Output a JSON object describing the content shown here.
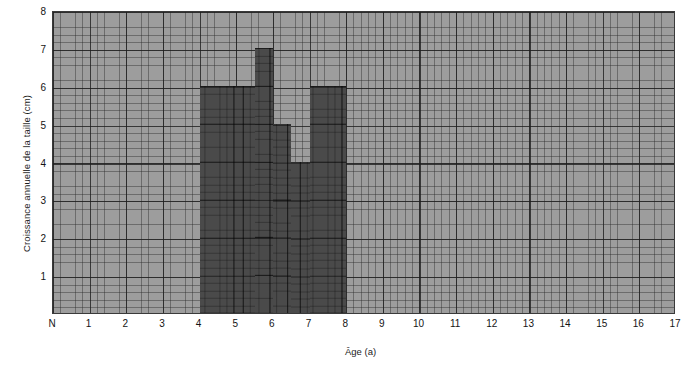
{
  "figure": {
    "background_color": "#ffffff",
    "plot_fill_color": "#9d9d9d",
    "bar_color": "#4a4a4a",
    "axis_color": "#3a3a3a"
  },
  "axes": {
    "x_title": "Âge (a)",
    "y_title": "Croissance annuelle de la taille (cm)",
    "x_ticks": [
      "N",
      "1",
      "2",
      "3",
      "4",
      "5",
      "6",
      "7",
      "8",
      "9",
      "10",
      "11",
      "12",
      "13",
      "14",
      "15",
      "16",
      "17"
    ],
    "y_ticks": [
      "1",
      "2",
      "3",
      "4",
      "5",
      "6",
      "7",
      "8"
    ]
  },
  "chart_data": {
    "type": "bar",
    "title": "",
    "subtitle": "",
    "xlabel": "Âge (a)",
    "ylabel": "Croissance annuelle de la taille (cm)",
    "xlim": [
      0,
      17
    ],
    "ylim": [
      0,
      8
    ],
    "x_tick_labels": [
      "N",
      "1",
      "2",
      "3",
      "4",
      "5",
      "6",
      "7",
      "8",
      "9",
      "10",
      "11",
      "12",
      "13",
      "14",
      "15",
      "16",
      "17"
    ],
    "y_tick_labels": [
      "1",
      "2",
      "3",
      "4",
      "5",
      "6",
      "7",
      "8"
    ],
    "grid": true,
    "legend": "none",
    "note": "Histogram of annual height velocity; bars are half-year-wide blocks spanning age 4 to 8 years. Remaining ages have no plotted bar.",
    "bins": [
      {
        "x_start": 4.0,
        "x_end": 5.0,
        "value": 6
      },
      {
        "x_start": 5.0,
        "x_end": 5.5,
        "value": 6
      },
      {
        "x_start": 5.5,
        "x_end": 6.0,
        "value": 7
      },
      {
        "x_start": 6.0,
        "x_end": 6.5,
        "value": 5
      },
      {
        "x_start": 6.5,
        "x_end": 7.0,
        "value": 4
      },
      {
        "x_start": 7.0,
        "x_end": 8.0,
        "value": 6
      }
    ],
    "categories": [
      "4.0–5.0",
      "5.0–5.5",
      "5.5–6.0",
      "6.0–6.5",
      "6.5–7.0",
      "7.0–8.0"
    ],
    "values": [
      6,
      6,
      7,
      5,
      4,
      6
    ]
  }
}
